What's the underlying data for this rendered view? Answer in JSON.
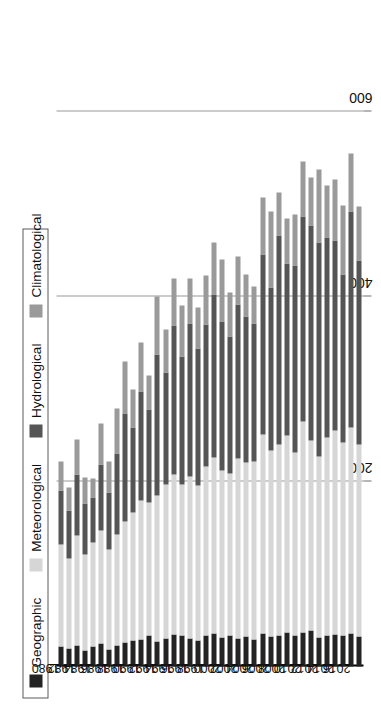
{
  "legend": {
    "items": [
      {
        "label": "Geographic",
        "color": "#232323"
      },
      {
        "label": "Meteorological",
        "color": "#d6d6d6"
      },
      {
        "label": "Hydrological",
        "color": "#555555"
      },
      {
        "label": "Climatological",
        "color": "#9a9a9a"
      }
    ]
  },
  "axis": {
    "tick_labels": [
      "600",
      "400",
      "200"
    ],
    "tick_values": [
      600,
      400,
      200
    ]
  },
  "chart_data": {
    "type": "bar",
    "title": "",
    "subtitle": "",
    "xlabel": "",
    "ylabel": "",
    "orientation": "horizontal",
    "stacked": true,
    "grid": true,
    "legend_position": "top-left",
    "xlim": [
      0,
      700
    ],
    "x_ticks": [
      200,
      400,
      600
    ],
    "categories": [
      "1980",
      "1981",
      "1982",
      "1983",
      "1984",
      "1985",
      "1986",
      "1987",
      "1988",
      "1989",
      "1990",
      "1991",
      "1992",
      "1993",
      "1994",
      "1995",
      "1996",
      "1997",
      "1998",
      "1999",
      "2000",
      "2001",
      "2002",
      "2003",
      "2004",
      "2005",
      "2006",
      "2007",
      "2008",
      "2009",
      "2010",
      "2011",
      "2012",
      "2013",
      "2014",
      "2015",
      "2016",
      "2017"
    ],
    "tick_categories": [
      "1980",
      "1982",
      "1984",
      "1986",
      "1988",
      "1990",
      "1992",
      "1994",
      "1996",
      "1998",
      "2000",
      "2002",
      "2004",
      "2006",
      "2008",
      "2010",
      "2012",
      "2014",
      "2016"
    ],
    "series": [
      {
        "name": "Geographic",
        "color": "#232323",
        "values": [
          22,
          19,
          23,
          17,
          22,
          25,
          18,
          23,
          26,
          28,
          29,
          33,
          27,
          30,
          35,
          34,
          30,
          28,
          34,
          36,
          31,
          33,
          30,
          32,
          29,
          36,
          32,
          34,
          37,
          33,
          37,
          39,
          31,
          33,
          35,
          33,
          36,
          32
        ]
      },
      {
        "name": "Meteorological",
        "color": "#d6d6d6",
        "values": [
          110,
          98,
          118,
          104,
          112,
          122,
          108,
          120,
          131,
          138,
          150,
          144,
          158,
          167,
          172,
          163,
          175,
          168,
          182,
          190,
          181,
          176,
          195,
          188,
          192,
          215,
          201,
          206,
          212,
          198,
          228,
          205,
          196,
          214,
          220,
          209,
          222,
          208
        ]
      },
      {
        "name": "Hydrological",
        "color": "#555555",
        "values": [
          58,
          52,
          66,
          55,
          49,
          71,
          62,
          87,
          116,
          92,
          118,
          101,
          152,
          121,
          161,
          138,
          166,
          148,
          154,
          176,
          161,
          147,
          166,
          158,
          150,
          194,
          176,
          226,
          186,
          202,
          221,
          232,
          231,
          216,
          205,
          182,
          234,
          199
        ]
      },
      {
        "name": "Climatological",
        "color": "#9a9a9a",
        "values": [
          31,
          24,
          38,
          28,
          20,
          44,
          33,
          49,
          56,
          41,
          53,
          36,
          63,
          46,
          51,
          55,
          48,
          44,
          52,
          56,
          67,
          48,
          52,
          46,
          40,
          62,
          83,
          46,
          49,
          55,
          60,
          52,
          79,
          57,
          66,
          74,
          62,
          58
        ]
      }
    ]
  }
}
